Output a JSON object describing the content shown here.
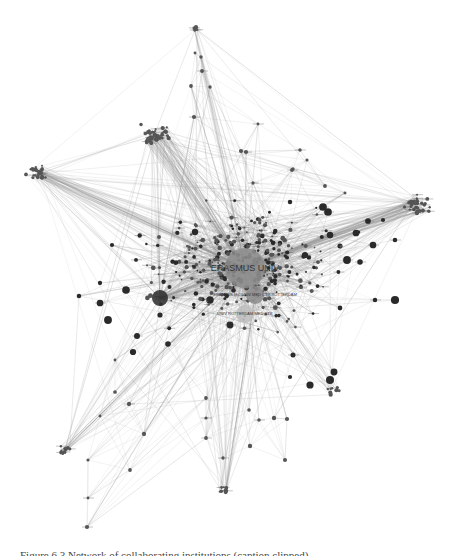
{
  "figure": {
    "type": "network-graph",
    "style": "grayscale force-directed collaboration network",
    "caption_visible": "Figure 6.3  Network of collaborating institutions (caption clipped)",
    "colors": {
      "edge": "#9a9a9a",
      "node_dark": "#2a2a2a",
      "node_mid": "#555555",
      "node_light": "#bdbdbd",
      "hub": "#8c8c8c"
    }
  },
  "labels": {
    "hub_main": "ERASMUS UNIV",
    "hub_left": "TNO",
    "hub_sub1": "ERASMUS MC UNIV MED CTR ROTTERDAM",
    "hub_sub2": "UNIV ROTTERDAM MED CTR"
  },
  "hubs": [
    {
      "id": "erasmus",
      "x": 245,
      "y": 268,
      "r": 20,
      "shade": "hub",
      "label": "hub_main",
      "fs": 9
    },
    {
      "id": "left",
      "x": 160,
      "y": 298,
      "r": 8,
      "shade": "node_dark",
      "label": "hub_left",
      "fs": 5
    },
    {
      "id": "sub1",
      "x": 255,
      "y": 295,
      "r": 9,
      "shade": "hub",
      "label": "hub_sub1",
      "fs": 4
    },
    {
      "id": "sub2",
      "x": 245,
      "y": 314,
      "r": 9,
      "shade": "node_light",
      "label": "hub_sub2",
      "fs": 4
    }
  ],
  "clusters": [
    {
      "name": "top-spike",
      "x": 195,
      "y": 28,
      "n": 4,
      "spread": 4
    },
    {
      "name": "top-left-ball",
      "x": 155,
      "y": 135,
      "n": 40,
      "spread": 12
    },
    {
      "name": "far-left-ball",
      "x": 37,
      "y": 172,
      "n": 25,
      "spread": 9
    },
    {
      "name": "right-ball",
      "x": 418,
      "y": 205,
      "n": 35,
      "spread": 12
    },
    {
      "name": "bottom-center",
      "x": 223,
      "y": 490,
      "n": 8,
      "spread": 5
    },
    {
      "name": "bottom-left",
      "x": 65,
      "y": 450,
      "n": 10,
      "spread": 6
    },
    {
      "name": "bottom-right-drop",
      "x": 335,
      "y": 390,
      "n": 8,
      "spread": 6
    }
  ],
  "spine_nodes": [
    [
      195,
      53
    ],
    [
      201,
      57
    ],
    [
      202,
      71
    ],
    [
      191,
      86
    ],
    [
      210,
      87
    ],
    [
      194,
      117
    ],
    [
      258,
      124
    ],
    [
      241,
      151
    ],
    [
      246,
      152
    ],
    [
      300,
      150
    ],
    [
      293,
      169
    ],
    [
      307,
      160
    ],
    [
      325,
      186
    ],
    [
      345,
      193
    ],
    [
      253,
      183
    ],
    [
      292,
      170
    ],
    [
      115,
      360
    ],
    [
      115,
      392
    ],
    [
      129,
      404
    ],
    [
      100,
      416
    ],
    [
      144,
      434
    ],
    [
      88,
      460
    ],
    [
      130,
      470
    ],
    [
      88,
      498
    ],
    [
      87,
      527
    ],
    [
      206,
      398
    ],
    [
      206,
      418
    ],
    [
      206,
      438
    ],
    [
      223,
      458
    ],
    [
      249,
      410
    ],
    [
      259,
      420
    ],
    [
      250,
      446
    ],
    [
      285,
      460
    ],
    [
      274,
      418
    ],
    [
      287,
      419
    ]
  ],
  "dark_nodes": [
    [
      112,
      245
    ],
    [
      160,
      315
    ],
    [
      133,
      352
    ],
    [
      195,
      232
    ],
    [
      280,
      243
    ],
    [
      330,
      235
    ],
    [
      340,
      246
    ],
    [
      368,
      221
    ],
    [
      373,
      245
    ],
    [
      328,
      212
    ],
    [
      360,
      262
    ],
    [
      375,
      300
    ],
    [
      340,
      308
    ],
    [
      293,
      355
    ],
    [
      290,
      377
    ],
    [
      330,
      380
    ],
    [
      310,
      385
    ],
    [
      334,
      372
    ],
    [
      126,
      290
    ],
    [
      100,
      283
    ],
    [
      100,
      303
    ],
    [
      108,
      320
    ],
    [
      79,
      296
    ],
    [
      137,
      336
    ],
    [
      168,
      344
    ],
    [
      210,
      300
    ],
    [
      230,
      325
    ],
    [
      395,
      300
    ],
    [
      383,
      220
    ],
    [
      395,
      240
    ],
    [
      347,
      260
    ],
    [
      323,
      207
    ],
    [
      356,
      233
    ],
    [
      290,
      202
    ],
    [
      305,
      255
    ]
  ],
  "rng_seed": 7,
  "random_nodes": 340,
  "random_edges": 1400
}
